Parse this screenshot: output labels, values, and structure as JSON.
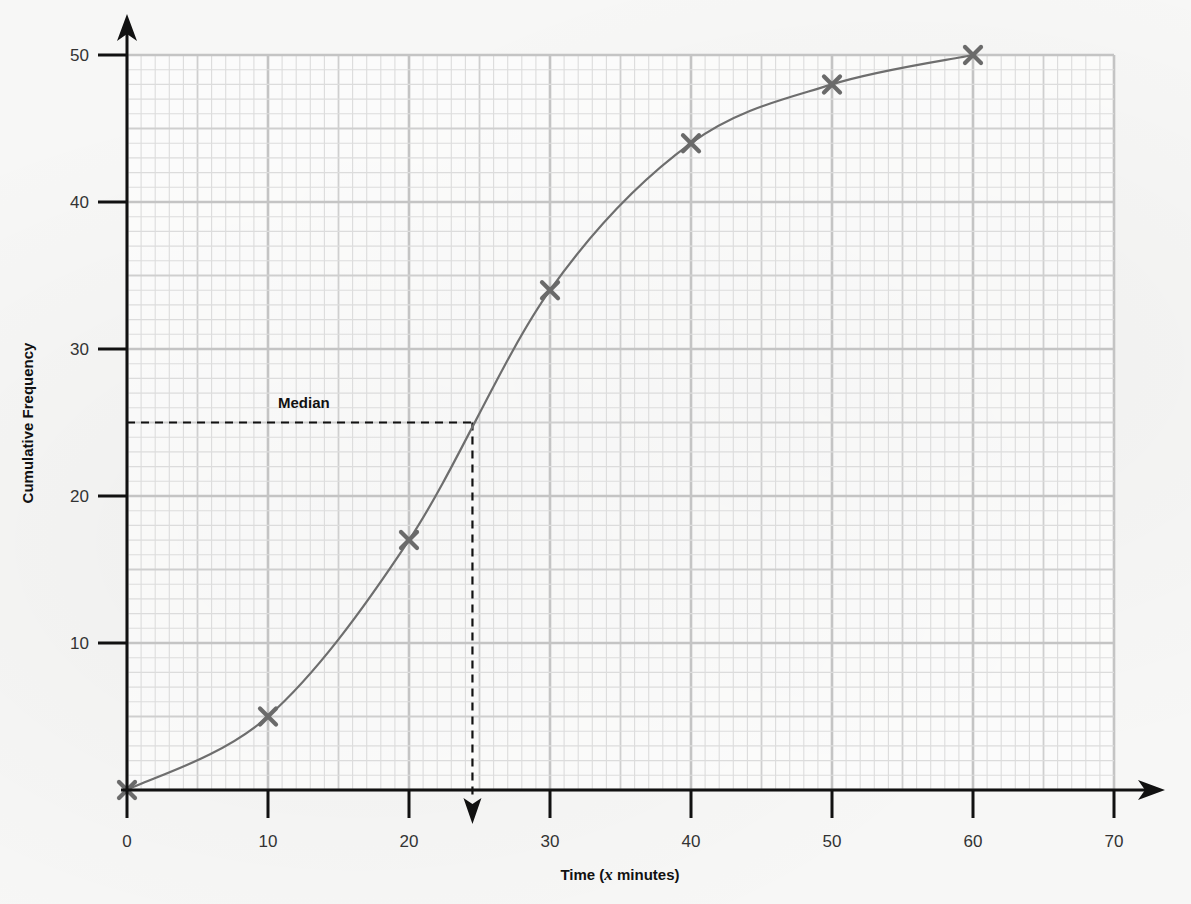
{
  "chart_data": {
    "type": "line",
    "title": "",
    "xlabel": "Time (x minutes)",
    "ylabel": "Cumulative Frequency",
    "x": [
      0,
      10,
      20,
      30,
      40,
      50,
      60
    ],
    "series": [
      {
        "name": "Cumulative Frequency",
        "values": [
          0,
          5,
          17,
          34,
          44,
          48,
          50
        ],
        "marker": "x",
        "smooth": true,
        "color": "#6e6e6e"
      }
    ],
    "xlim": [
      0,
      70
    ],
    "ylim": [
      0,
      50
    ],
    "xticks": [
      0,
      10,
      20,
      30,
      40,
      50,
      60,
      70
    ],
    "yticks": [
      10,
      20,
      30,
      40,
      50
    ],
    "grid": {
      "on": true,
      "major": 10,
      "mid": 5,
      "minor": 1
    },
    "legend": null,
    "annotations": [
      {
        "text": "Median",
        "type": "dashed-guide",
        "y": 25,
        "x": 24.5,
        "arrow": "down-to-x-axis"
      }
    ]
  },
  "labels": {
    "xlabel_prefix": "Time (",
    "xlabel_var": "x",
    "xlabel_suffix": " minutes)",
    "ylabel": "Cumulative Frequency",
    "median": "Median"
  },
  "colors": {
    "axis": "#111111",
    "grid_minor": "#dcdcdc",
    "grid_mid": "#cfcfcf",
    "grid_major": "#c4c4c4",
    "curve": "#6e6e6e",
    "marker": "#6a6a6a",
    "guide": "#111111"
  }
}
